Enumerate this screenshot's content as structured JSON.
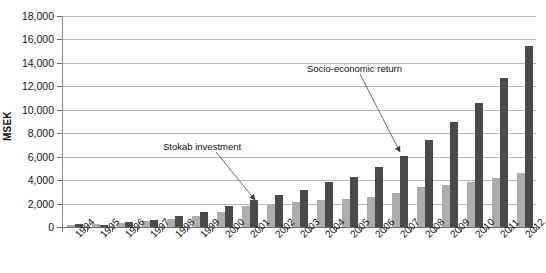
{
  "chart_data": {
    "type": "bar",
    "title": "",
    "xlabel": "",
    "ylabel": "MSEK",
    "ylim": [
      0,
      18000
    ],
    "ytick_step": 2000,
    "yticks": [
      "0",
      "2,000",
      "4,000",
      "6,000",
      "8,000",
      "10,000",
      "12,000",
      "14,000",
      "16,000",
      "18,000"
    ],
    "grid": true,
    "legend_position": "none",
    "categories": [
      "1994",
      "1995",
      "1996",
      "1997",
      "1998",
      "1999",
      "2000",
      "2001",
      "2002",
      "2003",
      "2004",
      "2005",
      "2006",
      "2007",
      "2008",
      "2009",
      "2010",
      "2011",
      "2012"
    ],
    "series": [
      {
        "name": "Stokab investment",
        "color": "#adadad",
        "values": [
          200,
          250,
          350,
          500,
          700,
          900,
          1300,
          1800,
          1900,
          2100,
          2300,
          2400,
          2600,
          2900,
          3400,
          3600,
          3800,
          4200,
          4600
        ]
      },
      {
        "name": "Socio-economic return",
        "color": "#4a4a4a",
        "values": [
          250,
          150,
          400,
          600,
          900,
          1300,
          1800,
          2300,
          2700,
          3200,
          3800,
          4300,
          5100,
          6100,
          7400,
          9000,
          10600,
          12700,
          15400
        ]
      }
    ],
    "annotations": [
      {
        "text": "Stokab investment",
        "points_to_category": "2001",
        "points_to_series": "Stokab investment"
      },
      {
        "text": "Socio-economic return",
        "points_to_category": "2007",
        "points_to_series": "Socio-economic return"
      }
    ]
  }
}
